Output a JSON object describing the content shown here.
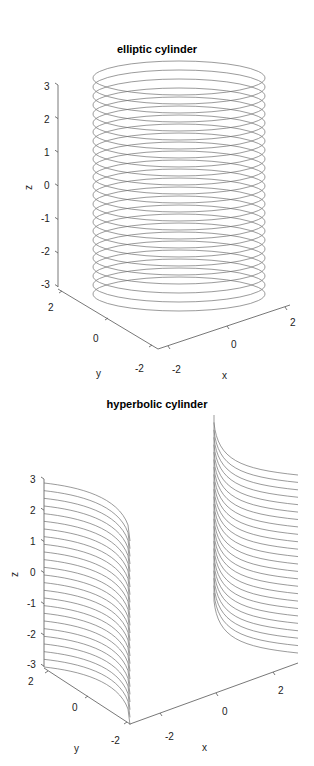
{
  "chart_data": [
    {
      "type": "line",
      "title": "elliptic cylinder",
      "xlabel": "x",
      "ylabel": "y",
      "zlabel": "z",
      "x_ticks": [
        "-2",
        "0",
        "2"
      ],
      "y_ticks": [
        "-2",
        "0",
        "2"
      ],
      "z_ticks": [
        "3",
        "2",
        "1",
        "0",
        "-1",
        "-2",
        "-3"
      ],
      "zlim": [
        -3,
        3
      ],
      "surface": "x^2/a^2 + y^2/b^2 = 1",
      "levels": 25,
      "line_color": "#707070"
    },
    {
      "type": "line",
      "title": "hyperbolic cylinder",
      "xlabel": "x",
      "ylabel": "y",
      "zlabel": "z",
      "x_ticks": [
        "-2",
        "0",
        "2"
      ],
      "y_ticks": [
        "-2",
        "0",
        "2"
      ],
      "z_ticks": [
        "3",
        "2",
        "1",
        "0",
        "-1",
        "-2",
        "-3"
      ],
      "zlim": [
        -3,
        3
      ],
      "surface": "x^2/a^2 - y^2/b^2 = 1",
      "levels": 25,
      "line_color": "#707070"
    }
  ]
}
